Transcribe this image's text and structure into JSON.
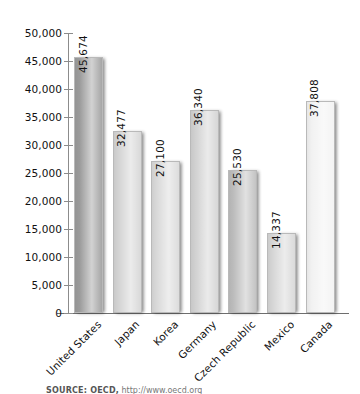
{
  "chart_data": {
    "type": "bar",
    "title": "",
    "subtitle": "",
    "xlabel": "",
    "ylabel": "",
    "ylim": [
      0,
      50000
    ],
    "grid": false,
    "legend": false,
    "categories": [
      "United States",
      "Japan",
      "Korea",
      "Germany",
      "Czech Republic",
      "Mexico",
      "Canada"
    ],
    "values": [
      45674,
      32477,
      27100,
      36340,
      25530,
      14337,
      37808
    ],
    "value_labels": [
      "45,674",
      "32,477",
      "27,100",
      "36,340",
      "25,530",
      "14,337",
      "37,808"
    ],
    "bar_colors": [
      "#9c9c9c",
      "#d4d4d4",
      "#d9d9d9",
      "#d2d2d2",
      "#bdbdbd",
      "#d6d6d6",
      "#f2f2f2"
    ],
    "y_ticks": [
      0,
      5000,
      10000,
      15000,
      20000,
      25000,
      30000,
      35000,
      40000,
      45000,
      50000
    ],
    "y_tick_labels": [
      "0",
      "5,000",
      "10,000",
      "15,000",
      "20,000",
      "25,000",
      "30,000",
      "35,000",
      "40,000",
      "45,000",
      "50,000"
    ]
  },
  "footer": {
    "source_label": "SOURCE: OECD,",
    "source_url": "http://www.oecd.org"
  },
  "colors": {
    "axis": "#8c8c8c",
    "text": "#111111",
    "background": "#ffffff"
  }
}
